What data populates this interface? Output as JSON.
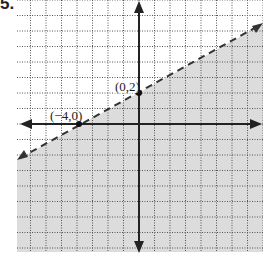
{
  "problem": {
    "number": "5."
  },
  "graph": {
    "origin_px": [
      139,
      124
    ],
    "unit_px": 15.5,
    "x_range": [
      -8,
      8
    ],
    "y_range": [
      -8,
      8
    ],
    "grid": true,
    "boundary": {
      "equation": "y = 1/2 x + 2",
      "style": "dashed",
      "slope": 0.5,
      "intercept": 2
    },
    "shaded_region": "below",
    "shade_color": "#dcdcdc",
    "points": [
      {
        "label": "(0,2)",
        "x": 0,
        "y": 2
      },
      {
        "label": "(-4,0)",
        "display": "(−4,0)",
        "x": -4,
        "y": 0
      }
    ]
  }
}
